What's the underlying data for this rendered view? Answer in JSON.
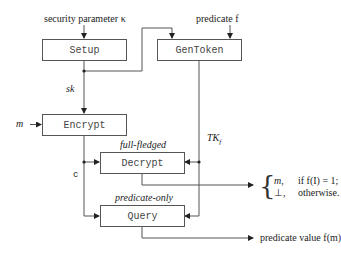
{
  "diagram": {
    "inputs": {
      "security_parameter": "security parameter κ",
      "predicate": "predicate f",
      "message": "m"
    },
    "boxes": {
      "setup": "Setup",
      "gentoken": "GenToken",
      "encrypt": "Encrypt",
      "decrypt": "Decrypt",
      "query": "Query"
    },
    "box_captions": {
      "decrypt": "full-fledged",
      "query": "predicate-only"
    },
    "edge_labels": {
      "secret_key": "sk",
      "ciphertext": "c",
      "token": "TK",
      "token_sub": "f"
    },
    "outputs": {
      "decrypt_cases": [
        {
          "value": "m,",
          "condition": "if f(I) = 1;"
        },
        {
          "value": "⊥,",
          "condition": "otherwise."
        }
      ],
      "query": "predicate value f(m)"
    }
  }
}
